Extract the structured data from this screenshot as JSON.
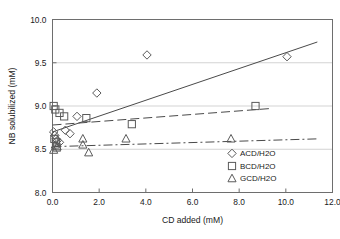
{
  "chart_data": {
    "type": "scatter",
    "title": "",
    "xlabel": "CD added (mM)",
    "ylabel": "NB solubilized (mM)",
    "xlim": [
      0.0,
      12.0
    ],
    "ylim": [
      8.0,
      10.0
    ],
    "xticks": [
      "0.0",
      "2.0",
      "4.0",
      "6.0",
      "8.0",
      "10.0",
      "12.0"
    ],
    "xtick_values": [
      0.0,
      2.0,
      4.0,
      6.0,
      8.0,
      10.0,
      12.0
    ],
    "yticks": [
      "8.0",
      "8.5",
      "9.0",
      "9.5",
      "10.0"
    ],
    "ytick_values": [
      8.0,
      8.5,
      9.0,
      9.5,
      10.0
    ],
    "grid": "horizontal",
    "legend_position": "bottom-right",
    "series": [
      {
        "name": "ACD/H2O",
        "marker": "diamond",
        "line_style": "solid",
        "points": [
          {
            "x": 0.05,
            "y": 8.7
          },
          {
            "x": 0.1,
            "y": 8.66
          },
          {
            "x": 0.15,
            "y": 8.62
          },
          {
            "x": 0.2,
            "y": 8.6
          },
          {
            "x": 0.3,
            "y": 8.58
          },
          {
            "x": 0.55,
            "y": 8.72
          },
          {
            "x": 0.75,
            "y": 8.68
          },
          {
            "x": 1.05,
            "y": 8.88
          },
          {
            "x": 1.9,
            "y": 9.15
          },
          {
            "x": 4.05,
            "y": 9.59
          },
          {
            "x": 10.05,
            "y": 9.57
          }
        ],
        "fit_line": {
          "x1": 0.0,
          "y1": 8.7,
          "x2": 11.35,
          "y2": 9.74
        }
      },
      {
        "name": "BCD/H2O",
        "marker": "square",
        "line_style": "dashed",
        "points": [
          {
            "x": 0.05,
            "y": 9.0
          },
          {
            "x": 0.12,
            "y": 8.96
          },
          {
            "x": 0.3,
            "y": 8.92
          },
          {
            "x": 0.5,
            "y": 8.88
          },
          {
            "x": 0.08,
            "y": 8.62
          },
          {
            "x": 0.15,
            "y": 8.58
          },
          {
            "x": 0.18,
            "y": 8.52
          },
          {
            "x": 1.45,
            "y": 8.86
          },
          {
            "x": 3.4,
            "y": 8.79
          },
          {
            "x": 8.7,
            "y": 9.0
          }
        ],
        "fit_line": {
          "x1": 0.0,
          "y1": 8.78,
          "x2": 9.3,
          "y2": 8.97
        }
      },
      {
        "name": "GCD/H2O",
        "marker": "triangle",
        "line_style": "dash-dot",
        "points": [
          {
            "x": 0.05,
            "y": 8.49
          },
          {
            "x": 0.12,
            "y": 8.55
          },
          {
            "x": 0.2,
            "y": 8.53
          },
          {
            "x": 1.3,
            "y": 8.62
          },
          {
            "x": 1.3,
            "y": 8.55
          },
          {
            "x": 1.55,
            "y": 8.46
          },
          {
            "x": 3.15,
            "y": 8.62
          },
          {
            "x": 7.65,
            "y": 8.62
          }
        ],
        "fit_line": {
          "x1": 0.0,
          "y1": 8.53,
          "x2": 11.35,
          "y2": 8.62
        }
      }
    ],
    "legend": [
      {
        "label": "ACD/H2O",
        "marker": "diamond"
      },
      {
        "label": "BCD/H2O",
        "marker": "square"
      },
      {
        "label": "GCD/H2O",
        "marker": "triangle"
      }
    ],
    "colors": {
      "axis": "#6e6e6e",
      "grid": "#c8c8c8",
      "marker": "#5a5a5a",
      "line": "#4a4a4a",
      "text": "#1a1a1a"
    }
  }
}
